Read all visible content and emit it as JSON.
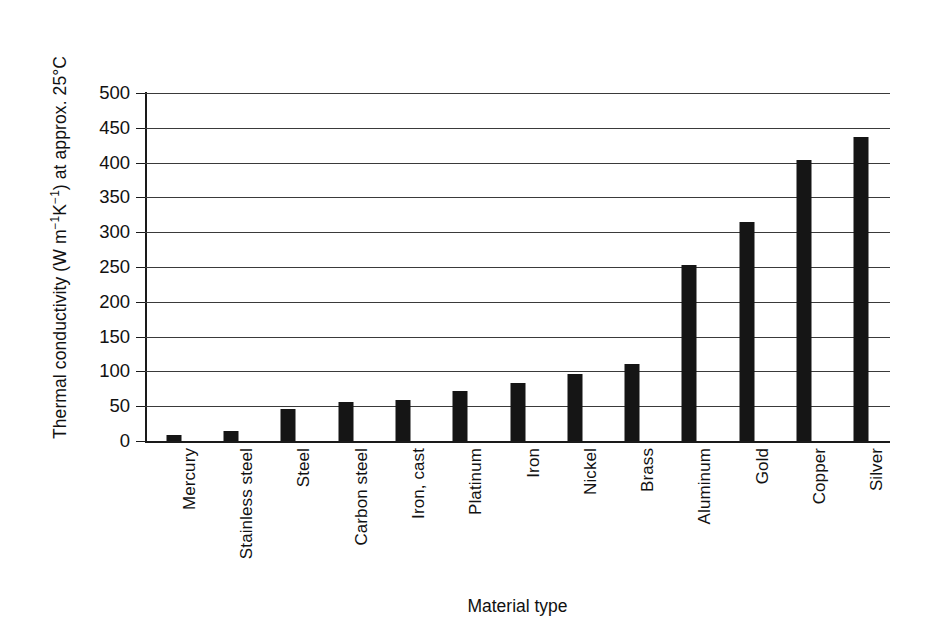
{
  "chart_data": {
    "type": "bar",
    "title": "",
    "xlabel": "Material type",
    "ylabel": "Thermal conductivity (W m⁻¹K⁻¹) at approx. 25°C",
    "ylabel_parts": {
      "prefix": "Thermal conductivity (W m",
      "sup1": "−1",
      "mid": "K",
      "sup2": "−1",
      "suffix": ") at approx. 25°C"
    },
    "categories": [
      "Mercury",
      "Stainless steel",
      "Steel",
      "Carbon steel",
      "Iron, cast",
      "Platinum",
      "Iron",
      "Nickel",
      "Brass",
      "Aluminum",
      "Gold",
      "Copper",
      "Silver"
    ],
    "values": [
      8,
      15,
      46,
      56,
      59,
      72,
      84,
      96,
      110,
      253,
      315,
      404,
      437
    ],
    "ylim": [
      0,
      500
    ],
    "ytick_values": [
      0,
      50,
      100,
      150,
      200,
      250,
      300,
      350,
      400,
      450,
      500
    ],
    "ytick_labels": [
      "0",
      "50",
      "100",
      "150",
      "200",
      "250",
      "300",
      "350",
      "400",
      "450",
      "500"
    ],
    "grid": true,
    "grid_axis": "y",
    "legend": false,
    "legend_position": "none",
    "bar_color": "#151515",
    "background_color": "#ffffff",
    "axis_color": "#1a1a1a",
    "grid_color": "#3a3a3a"
  }
}
